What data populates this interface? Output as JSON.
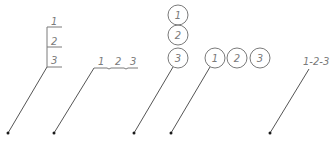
{
  "diagram": {
    "colors": {
      "line": "#7a7a7a",
      "leader": "#555555",
      "dot": "#1a1a1a",
      "background": "#ffffff"
    },
    "callouts": [
      {
        "style": "vertical-stack-with-shelves",
        "labels": [
          "1",
          "2",
          "3"
        ]
      },
      {
        "style": "horizontal-shelf-with-ticks",
        "labels": [
          "1",
          "2",
          "3"
        ]
      },
      {
        "style": "vertical-stacked-balloons",
        "labels": [
          "1",
          "2",
          "3"
        ]
      },
      {
        "style": "horizontal-balloons",
        "labels": [
          "1",
          "2",
          "3"
        ]
      },
      {
        "style": "dash-separated-text",
        "text": "1-2-3"
      }
    ]
  }
}
